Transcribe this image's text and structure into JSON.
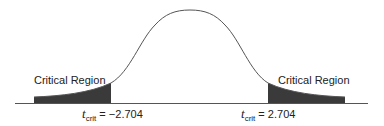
{
  "diagram": {
    "type": "t-distribution two-tailed critical regions",
    "left_region_label": "Critical Region",
    "right_region_label": "Critical Region",
    "left_critical": {
      "symbol": "t",
      "subscript": "crit",
      "equals": " = ",
      "value": "−2.704"
    },
    "right_critical": {
      "symbol": "t",
      "subscript": "crit",
      "equals": " = ",
      "value": "2.704"
    },
    "colors": {
      "curve": "#555555",
      "shaded_region": "#3a3a3a",
      "axis": "#555555"
    }
  }
}
